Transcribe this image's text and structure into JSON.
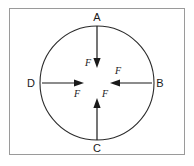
{
  "figure": {
    "background_color": "#ffffff",
    "frame": {
      "stroke_color": "#9a9a9a",
      "x": 9,
      "y": 8,
      "width": 176,
      "height": 147
    },
    "circle": {
      "stroke_color": "#2b2b2b",
      "center_x": 97,
      "center_y": 83,
      "radius": 57
    },
    "points": [
      {
        "id": "A",
        "label": "A",
        "position": "top",
        "label_x": 97,
        "label_y": 21
      },
      {
        "id": "B",
        "label": "B",
        "position": "right",
        "label_x": 160,
        "label_y": 86
      },
      {
        "id": "C",
        "label": "C",
        "position": "bottom",
        "label_x": 97,
        "label_y": 151
      },
      {
        "id": "D",
        "label": "D",
        "position": "left",
        "label_x": 31,
        "label_y": 86
      }
    ],
    "forces": [
      {
        "id": "force-from-A",
        "label": "F",
        "direction": "down",
        "from_point": "A",
        "tail_x": 97,
        "tail_y": 26,
        "tip_x": 97,
        "tip_y": 67,
        "label_x": 88,
        "label_y": 66
      },
      {
        "id": "force-from-B",
        "label": "F",
        "direction": "left",
        "from_point": "B",
        "tail_x": 152,
        "tail_y": 83,
        "tip_x": 111,
        "tip_y": 83,
        "label_x": 117,
        "label_y": 74
      },
      {
        "id": "force-from-C",
        "label": "F",
        "direction": "up",
        "from_point": "C",
        "tail_x": 97,
        "tail_y": 140,
        "tip_x": 97,
        "tip_y": 99,
        "label_x": 104,
        "label_y": 97
      },
      {
        "id": "force-from-D",
        "label": "F",
        "direction": "right",
        "from_point": "D",
        "tail_x": 42,
        "tail_y": 83,
        "tip_x": 83,
        "tip_y": 83,
        "label_x": 77,
        "label_y": 96
      }
    ]
  }
}
